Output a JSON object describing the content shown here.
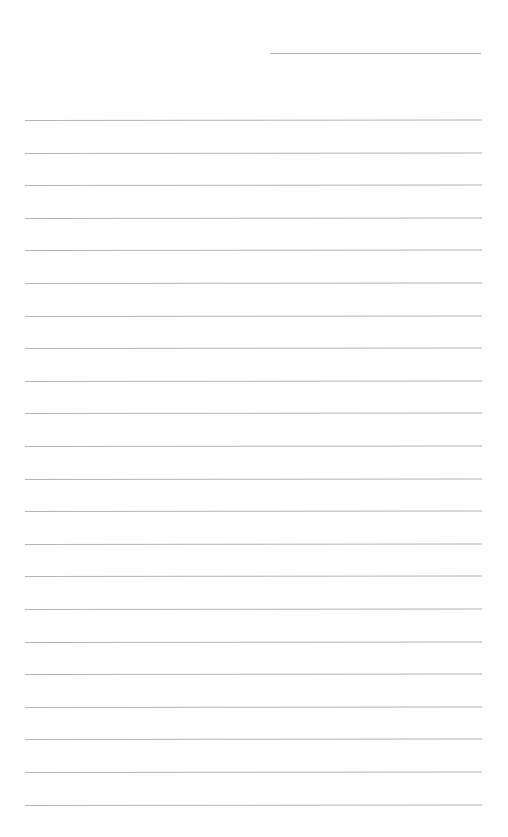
{
  "page": {
    "type": "lined-paper",
    "background": "#fefefe",
    "rule_color": "#b4b4b4",
    "header_rule": {
      "x1": 270,
      "x2": 481,
      "y": 53
    },
    "rules": {
      "count": 22,
      "first_y": 120,
      "spacing": 32.6,
      "x1": 25,
      "x2": 482
    }
  }
}
